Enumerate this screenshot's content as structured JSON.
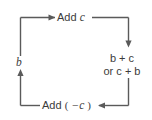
{
  "figure": {
    "type": "cycle-diagram",
    "background_color": "#ffffff",
    "line_color": "#5a5a5a",
    "text_color": "#3b3b3b",
    "nodes": {
      "start_value": "b",
      "result_line1": "b + c",
      "result_line2": "or c + b"
    },
    "edges": {
      "top_label": "Add c",
      "bottom_label": "Add ( −c )",
      "top_direction": "right",
      "right_direction": "down",
      "bottom_direction": "left",
      "left_direction": "up"
    },
    "operands": {
      "b": "b",
      "c": "c",
      "neg_c": "−c",
      "plus": "+",
      "or_word": "or",
      "add_word": "Add",
      "paren_open": "(",
      "paren_close": ")"
    }
  }
}
